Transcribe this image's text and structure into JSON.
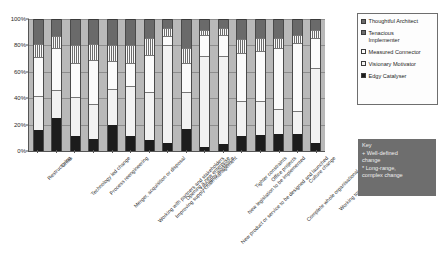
{
  "chart_data": {
    "type": "bar",
    "subtype": "stacked-percentage",
    "title": "",
    "xlabel": "",
    "ylabel": "",
    "ylim": [
      0,
      100
    ],
    "ytick_labels": [
      "0%",
      "20%",
      "40%",
      "60%",
      "80%",
      "100%"
    ],
    "ytick_values": [
      0,
      20,
      40,
      60,
      80,
      100
    ],
    "grid": true,
    "legend_position": "right",
    "categories": [
      "Restructuring",
      "Crisis",
      "Technology led change",
      "Process reengineering",
      "Merger, acquisition or disposal",
      "Working with partners and stakeholders",
      "Improving supply chain management",
      "Opening a new enterprise",
      "Unhappy workforce",
      "New product or service to be designed and launched",
      "New legislation to be implemented",
      "Tighter constraints",
      "Office projects",
      "Complete whole organisational change",
      "Culture change",
      "Working towards 5 year strategy"
    ],
    "series": [
      {
        "name": "Edgy Catalyser",
        "color": "#1c1c1c",
        "values": [
          16,
          25,
          11,
          9,
          20,
          11,
          8,
          6,
          17,
          3,
          5,
          11,
          12,
          13,
          13,
          6
        ]
      },
      {
        "name": "Visionary Motivator",
        "color": "#f2f2f2",
        "values": [
          26,
          21,
          30,
          27,
          27,
          38,
          37,
          74,
          28,
          69,
          67,
          27,
          26,
          19,
          17,
          57
        ]
      },
      {
        "name": "Measured Connector",
        "color": "#fbfbfb",
        "values": [
          29,
          32,
          26,
          33,
          21,
          18,
          28,
          7,
          22,
          16,
          16,
          36,
          38,
          46,
          52,
          23
        ]
      },
      {
        "name": "Tenacious Implementer",
        "color": "#fafafa",
        "values": [
          10,
          9,
          13,
          12,
          12,
          13,
          13,
          6,
          11,
          4,
          5,
          11,
          10,
          8,
          6,
          6
        ]
      },
      {
        "name": "Thoughtful Architect",
        "color": "#6a6a6a",
        "values": [
          19,
          13,
          20,
          19,
          20,
          20,
          14,
          7,
          22,
          8,
          7,
          15,
          14,
          14,
          12,
          8
        ]
      }
    ]
  },
  "legend": {
    "items": [
      {
        "label": "Thoughtful Architect",
        "swatch": "sw-thoughtful"
      },
      {
        "label": "Tenacious\nImplementer",
        "swatch": "sw-tenacious"
      },
      {
        "label": "Measured Connector",
        "swatch": "sw-measured"
      },
      {
        "label": "Visionary Motivator",
        "swatch": "sw-visionary"
      },
      {
        "label": "Edgy Catalyser",
        "swatch": "sw-edgy"
      }
    ]
  },
  "key_box": {
    "title": "Key",
    "line1": "+ Well-defined\nchange",
    "line2": "* Long-range,\ncomplex change"
  }
}
